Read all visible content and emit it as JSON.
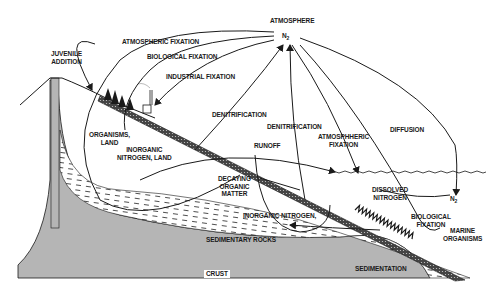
{
  "diagram": {
    "colors": {
      "ink": "#1a1a1a",
      "background": "#ffffff",
      "stipple": "#555555"
    },
    "labels": {
      "atmosphere": "ATMOSPHERE",
      "n2_atmosphere": "N",
      "n2_sub": "2",
      "juvenile_addition": "JUVENILE\nADDITION",
      "atmospheric_fixation_land": "ATMOSPHERIC FIXATION",
      "biological_fixation_land": "BIOLOGICAL FIXATION",
      "industrial_fixation": "INDUSTRIAL FIXATION",
      "denitrification_land": "DENITRIFICATION",
      "denitrification_sea": "DENITRIFICATION",
      "atmospheric_fixation_sea": "ATMOSPHHERIC\nFIXATION",
      "diffusion": "DIFFUSION",
      "runoff": "RUNOFF",
      "organisms_land": "ORGANISMS,\nLAND",
      "inorganic_nitrogen_land": "INORGANIC\nNITROGEN, LAND",
      "decaying_organic_matter": "DECAYING\nORGANIC\nMATTER",
      "dissolved_nitrogen": "DISSOLVED\nNITROGEN",
      "n2_sea": "N",
      "n2_sea_sub": "2",
      "biological_fixation_sea": "BIOLOGICAL\nFIXATION",
      "marine_organisms": "MARINE\nORGANISMS",
      "inorganic_nitrogen": "INORGANIC NITROGEN,",
      "sedimentary_rocks": "SEDIMENTARY ROCKS",
      "sedimentation": "SEDIMENTATION",
      "crust": "CRUST"
    }
  }
}
